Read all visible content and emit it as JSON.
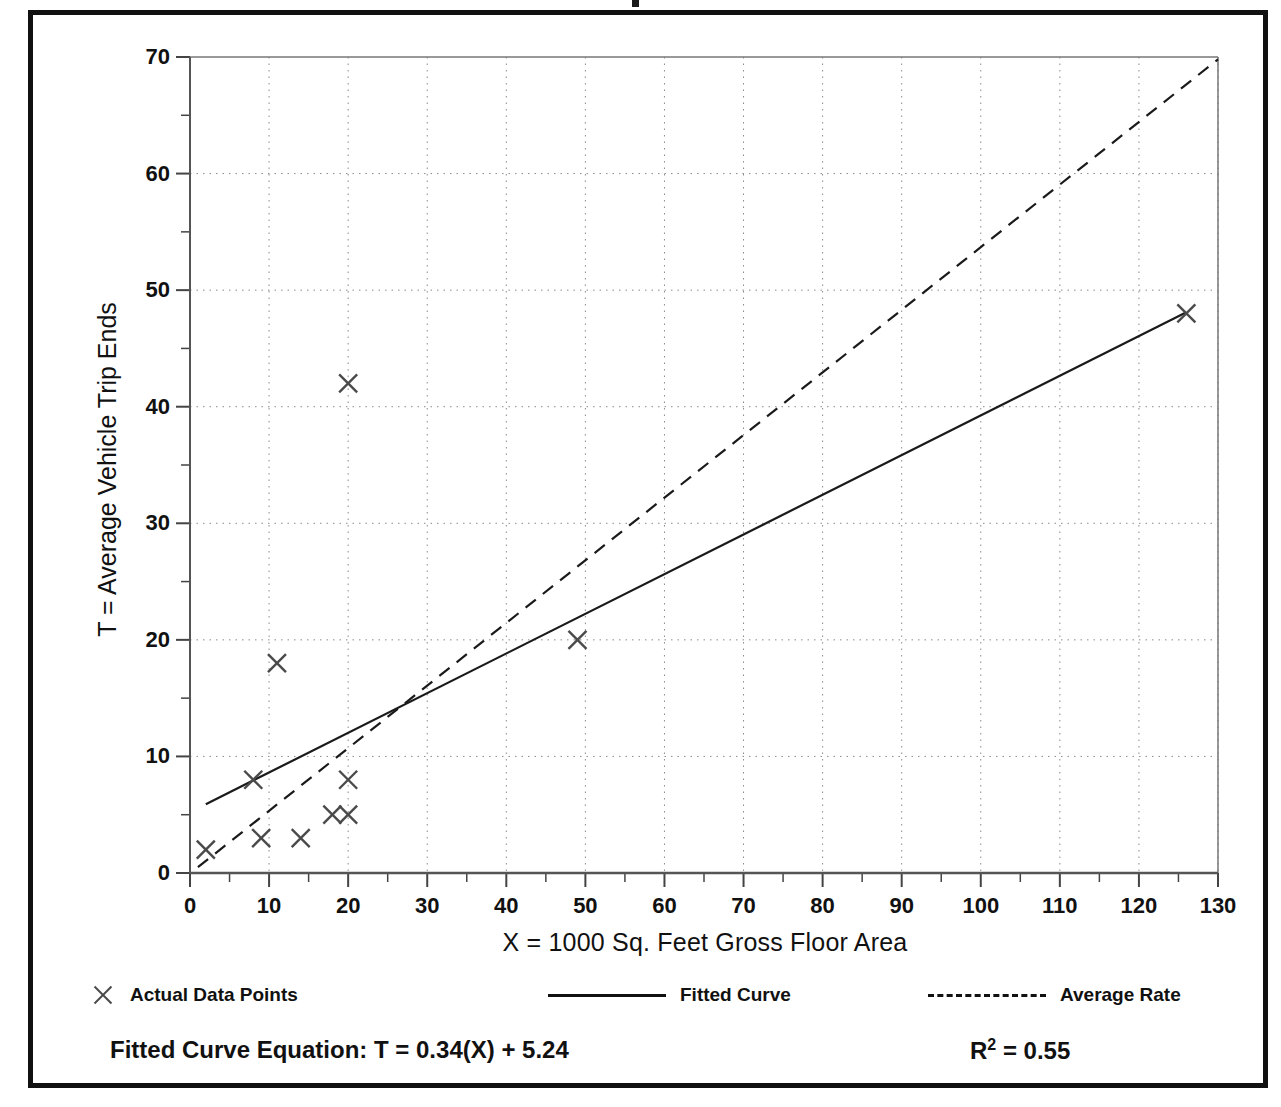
{
  "chart_data": {
    "type": "scatter",
    "title": "",
    "xlabel": "X = 1000 Sq. Feet Gross Floor Area",
    "ylabel": "T = Average Vehicle Trip Ends",
    "xlim": [
      0,
      130
    ],
    "ylim": [
      0,
      70
    ],
    "xticks": [
      0,
      10,
      20,
      30,
      40,
      50,
      60,
      70,
      80,
      90,
      100,
      110,
      120,
      130
    ],
    "yticks": [
      0,
      10,
      20,
      30,
      40,
      50,
      60,
      70
    ],
    "x_minor_tick_step": 5,
    "y_minor_tick_step": 5,
    "grid": "dotted gridlines at every major tick on both axes",
    "legend_position": "below plot, horizontal",
    "series": [
      {
        "name": "Actual Data Points",
        "type": "scatter",
        "marker": "x",
        "points": [
          {
            "x": 2,
            "y": 2
          },
          {
            "x": 8,
            "y": 8
          },
          {
            "x": 9,
            "y": 3
          },
          {
            "x": 11,
            "y": 18
          },
          {
            "x": 14,
            "y": 3
          },
          {
            "x": 18,
            "y": 5
          },
          {
            "x": 20,
            "y": 5
          },
          {
            "x": 20,
            "y": 8
          },
          {
            "x": 20,
            "y": 42
          },
          {
            "x": 49,
            "y": 20
          },
          {
            "x": 126,
            "y": 48
          }
        ]
      },
      {
        "name": "Fitted Curve",
        "type": "line",
        "style": "solid",
        "equation": "T = 0.34(X) + 5.24",
        "slope": 0.34,
        "intercept": 5.24,
        "x_start": 2,
        "x_end": 126,
        "y_start": 5.9,
        "y_end": 48.1
      },
      {
        "name": "Average Rate",
        "type": "line",
        "style": "dashed",
        "slope": 0.537,
        "intercept": 0,
        "x_start": 1,
        "x_end": 130,
        "y_start": 0.5,
        "y_end": 69.8
      }
    ]
  },
  "axes": {
    "y_tick_labels": [
      "70",
      "60",
      "50",
      "40",
      "30",
      "20",
      "10",
      "0"
    ],
    "x_tick_labels": [
      "0",
      "10",
      "20",
      "30",
      "40",
      "50",
      "60",
      "70",
      "80",
      "90",
      "100",
      "110",
      "120",
      "130"
    ],
    "x_title": "X = 1000 Sq. Feet Gross Floor Area",
    "y_title": "T = Average Vehicle Trip Ends"
  },
  "legend": {
    "items": [
      {
        "label": "Actual Data Points",
        "marker": "x-marker"
      },
      {
        "label": "Fitted Curve",
        "marker": "solid-line"
      },
      {
        "label": "Average Rate",
        "marker": "dashed-line"
      }
    ]
  },
  "footer": {
    "equation_label": "Fitted Curve Equation:  T = 0.34(X) + 5.24",
    "r_squared_prefix": "R",
    "r_squared_exponent": "2",
    "r_squared_value": " = 0.55"
  },
  "colors": {
    "frame": "#111111",
    "line": "#1a1a1a",
    "grid": "#8a8a8a",
    "marker": "#4a4a4a",
    "background": "#ffffff"
  }
}
